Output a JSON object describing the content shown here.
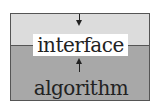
{
  "diagram": {
    "title": "",
    "layers": [
      {
        "name": "interface",
        "label": "interface",
        "fill": "#dcdcdc"
      },
      {
        "name": "algorithm",
        "label": "algorithm",
        "fill": "#a8a8a8"
      }
    ],
    "arrows": [
      {
        "direction": "down",
        "target": "interface"
      },
      {
        "direction": "up",
        "target": "interface"
      }
    ]
  }
}
